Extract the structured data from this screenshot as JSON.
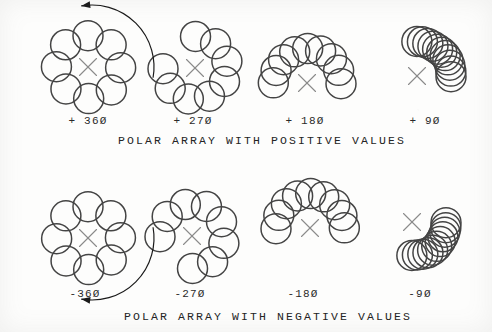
{
  "page": {
    "background_color": "#fdfdfc",
    "ink_color": "#444444",
    "center_mark_color": "#8a8a8a",
    "arrow_color": "#1a1a1a",
    "width": 492,
    "height": 332
  },
  "sections": [
    {
      "id": "positive",
      "caption": "POLAR ARRAY  WITH POSITIVE VALUES",
      "caption_x": 262,
      "caption_y": 142,
      "direction": "counterclockwise",
      "arrow": {
        "present": true,
        "name": "ccw-rotation-arrow",
        "cx": 92,
        "cy": 67,
        "r": 62,
        "start_deg": -10,
        "end_deg": 100,
        "head_at": "end"
      },
      "cells": [
        {
          "id": "pos-360",
          "label": "+ 360",
          "angle_value": 360,
          "label_x": 88,
          "label_y": 122,
          "center_x": 88,
          "center_y": 67,
          "ring_radius": 32,
          "circle_radius": 15,
          "count": 8,
          "span_deg": 360,
          "start_deg": 90,
          "sweep": "ccw"
        },
        {
          "id": "pos-270",
          "label": "+ 270",
          "angle_value": 270,
          "label_x": 193,
          "label_y": 122,
          "center_x": 195,
          "center_y": 68,
          "ring_radius": 32,
          "circle_radius": 15,
          "count": 8,
          "span_deg": 270,
          "start_deg": 180,
          "sweep": "ccw"
        },
        {
          "id": "pos-180",
          "label": "+ 180",
          "angle_value": 180,
          "label_x": 305,
          "label_y": 122,
          "center_x": 307,
          "center_y": 83,
          "ring_radius": 34,
          "circle_radius": 15,
          "count": 9,
          "span_deg": 180,
          "start_deg": 0,
          "sweep": "ccw"
        },
        {
          "id": "pos-90",
          "label": "+ 90",
          "angle_value": 90,
          "label_x": 425,
          "label_y": 122,
          "center_x": 417,
          "center_y": 76,
          "ring_radius": 34,
          "circle_radius": 15,
          "count": 11,
          "span_deg": 90,
          "start_deg": 0,
          "sweep": "ccw"
        }
      ]
    },
    {
      "id": "negative",
      "caption": "POLAR ARRAY WITH NEGATIVE VALUES",
      "caption_x": 268,
      "caption_y": 318,
      "direction": "clockwise",
      "arrow": {
        "present": true,
        "name": "cw-rotation-arrow",
        "cx": 92,
        "cy": 238,
        "r": 62,
        "start_deg": 10,
        "end_deg": -100,
        "head_at": "end"
      },
      "cells": [
        {
          "id": "neg-360",
          "label": "-360",
          "angle_value": -360,
          "label_x": 85,
          "label_y": 295,
          "center_x": 88,
          "center_y": 238,
          "ring_radius": 32,
          "circle_radius": 15,
          "count": 8,
          "span_deg": 360,
          "start_deg": 90,
          "sweep": "cw"
        },
        {
          "id": "neg-270",
          "label": "-270",
          "angle_value": -270,
          "label_x": 190,
          "label_y": 295,
          "center_x": 192,
          "center_y": 236,
          "ring_radius": 32,
          "circle_radius": 15,
          "count": 8,
          "span_deg": 270,
          "start_deg": 180,
          "sweep": "cw"
        },
        {
          "id": "neg-180",
          "label": "-180",
          "angle_value": -180,
          "label_x": 303,
          "label_y": 295,
          "center_x": 310,
          "center_y": 228,
          "ring_radius": 34,
          "circle_radius": 15,
          "count": 9,
          "span_deg": 180,
          "start_deg": 180,
          "sweep": "cw"
        },
        {
          "id": "neg-90",
          "label": "-90",
          "angle_value": -90,
          "label_x": 420,
          "label_y": 295,
          "center_x": 412,
          "center_y": 222,
          "ring_radius": 34,
          "circle_radius": 15,
          "count": 11,
          "span_deg": 90,
          "start_deg": 0,
          "sweep": "cw"
        }
      ]
    }
  ]
}
